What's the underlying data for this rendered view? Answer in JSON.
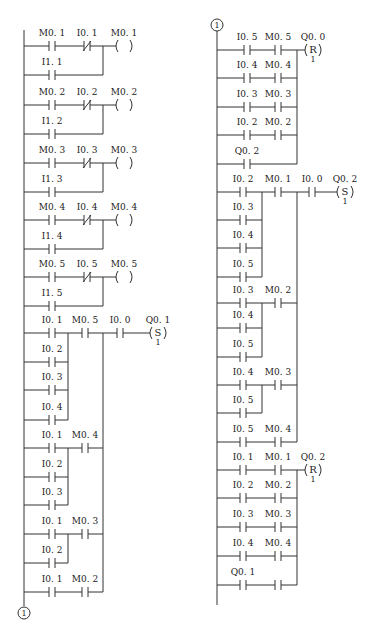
{
  "diagram": {
    "type": "ladder-logic",
    "connector_label": "1",
    "left_column": {
      "rungs": [
        {
          "branches": [
            [
              "M0.1",
              "NC:I0.1"
            ],
            [
              "I1.1"
            ]
          ],
          "series_after": [],
          "coil": {
            "label": "M0.1",
            "type": ""
          }
        },
        {
          "branches": [
            [
              "M0.2",
              "NC:I0.2"
            ],
            [
              "I1.2"
            ]
          ],
          "series_after": [],
          "coil": {
            "label": "M0.2",
            "type": ""
          }
        },
        {
          "branches": [
            [
              "M0.3",
              "NC:I0.3"
            ],
            [
              "I1.3"
            ]
          ],
          "series_after": [],
          "coil": {
            "label": "M0.3",
            "type": ""
          }
        },
        {
          "branches": [
            [
              "M0.4",
              "NC:I0.4"
            ],
            [
              "I1.4"
            ]
          ],
          "series_after": [],
          "coil": {
            "label": "M0.4",
            "type": ""
          }
        },
        {
          "branches": [
            [
              "M0.5",
              "NC:I0.5"
            ],
            [
              "I1.5"
            ]
          ],
          "series_after": [],
          "coil": {
            "label": "M0.5",
            "type": ""
          }
        },
        {
          "groups": [
            {
              "parallel": [
                "I0.1",
                "I0.2",
                "I0.3",
                "I0.4"
              ],
              "series": "M0.5"
            },
            {
              "parallel": [
                "I0.1",
                "I0.2",
                "I0.3"
              ],
              "series": "M0.4"
            },
            {
              "parallel": [
                "I0.1",
                "I0.2"
              ],
              "series": "M0.3"
            },
            {
              "parallel": [
                "I0.1"
              ],
              "series": "M0.2"
            }
          ],
          "series_after": [
            "I0.0"
          ],
          "coil": {
            "label": "Q0.1",
            "type": "S",
            "count": "1"
          }
        }
      ]
    },
    "right_column": {
      "rungs": [
        {
          "branches": [
            [
              "I0.5",
              "M0.5"
            ],
            [
              "I0.4",
              "M0.4"
            ],
            [
              "I0.3",
              "M0.3"
            ],
            [
              "I0.2",
              "M0.2"
            ],
            [
              "Q0.2"
            ]
          ],
          "coil": {
            "label": "Q0.0",
            "type": "R",
            "count": "1"
          }
        },
        {
          "groups": [
            {
              "parallel": [
                "I0.2",
                "I0.3",
                "I0.4",
                "I0.5"
              ],
              "series": "M0.1"
            },
            {
              "parallel": [
                "I0.3",
                "I0.4",
                "I0.5"
              ],
              "series": "M0.2"
            },
            {
              "parallel": [
                "I0.4",
                "I0.5"
              ],
              "series": "M0.3"
            },
            {
              "parallel": [
                "I0.5"
              ],
              "series": "M0.4"
            }
          ],
          "series_after": [
            "I0.0"
          ],
          "coil": {
            "label": "Q0.2",
            "type": "S",
            "count": "1"
          }
        },
        {
          "branches": [
            [
              "I0.1",
              "M0.1"
            ],
            [
              "I0.2",
              "M0.2"
            ],
            [
              "I0.3",
              "M0.3"
            ],
            [
              "I0.4",
              "M0.4"
            ],
            [
              "Q0.1",
              ""
            ]
          ],
          "coil": {
            "label": "Q0.2",
            "type": "R",
            "count": "1"
          }
        }
      ]
    }
  }
}
